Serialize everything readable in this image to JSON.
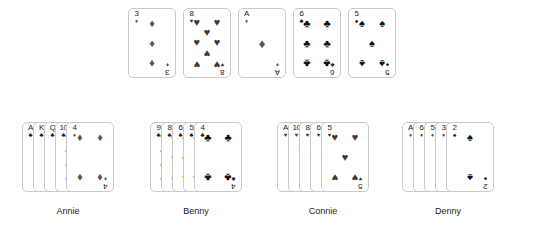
{
  "figure": {
    "background": "#ffffff",
    "suit_glyphs": {
      "spade": "♠",
      "heart": "♥",
      "diamond": "♦",
      "club": "♣"
    },
    "suit_colors": {
      "spade": "#111111",
      "heart": "#3a3a3a",
      "diamond": "#555555",
      "club": "#111111"
    }
  },
  "community_row": {
    "name": "community-cards",
    "cards": [
      {
        "rank": "3",
        "suit": "diamond",
        "pip_count": 3,
        "label": "3 of Diamonds"
      },
      {
        "rank": "8",
        "suit": "heart",
        "pip_count": 8,
        "label": "8 of Hearts"
      },
      {
        "rank": "A",
        "suit": "diamond",
        "pip_count": 1,
        "label": "Ace of Diamonds"
      },
      {
        "rank": "6",
        "suit": "club",
        "pip_count": 6,
        "label": "6 of Clubs"
      },
      {
        "rank": "5",
        "suit": "spade",
        "pip_count": 5,
        "label": "5 of Spades"
      }
    ]
  },
  "hands": [
    {
      "player": "Annie",
      "cards": [
        {
          "rank": "A",
          "suit": "club",
          "pip_count": 1,
          "label": "Ace of Clubs"
        },
        {
          "rank": "K",
          "suit": "club",
          "pip_count": 0,
          "label": "King of Clubs"
        },
        {
          "rank": "Q",
          "suit": "club",
          "pip_count": 0,
          "label": "Queen of Clubs"
        },
        {
          "rank": "10",
          "suit": "club",
          "pip_count": 10,
          "label": "10 of Clubs"
        },
        {
          "rank": "4",
          "suit": "diamond",
          "pip_count": 4,
          "label": "4 of Diamonds"
        }
      ]
    },
    {
      "player": "Benny",
      "cards": [
        {
          "rank": "9",
          "suit": "club",
          "pip_count": 9,
          "label": "9 of Clubs"
        },
        {
          "rank": "8",
          "suit": "club",
          "pip_count": 8,
          "label": "8 of Clubs"
        },
        {
          "rank": "6",
          "suit": "club",
          "pip_count": 6,
          "label": "6 of Clubs"
        },
        {
          "rank": "5",
          "suit": "club",
          "pip_count": 5,
          "label": "5 of Clubs"
        },
        {
          "rank": "4",
          "suit": "club",
          "pip_count": 4,
          "label": "4 of Clubs"
        }
      ]
    },
    {
      "player": "Connie",
      "cards": [
        {
          "rank": "A",
          "suit": "heart",
          "pip_count": 1,
          "label": "Ace of Hearts"
        },
        {
          "rank": "10",
          "suit": "heart",
          "pip_count": 10,
          "label": "10 of Hearts"
        },
        {
          "rank": "8",
          "suit": "heart",
          "pip_count": 8,
          "label": "8 of Hearts"
        },
        {
          "rank": "6",
          "suit": "heart",
          "pip_count": 6,
          "label": "6 of Hearts"
        },
        {
          "rank": "5",
          "suit": "heart",
          "pip_count": 5,
          "label": "5 of Hearts"
        }
      ]
    },
    {
      "player": "Denny",
      "cards": [
        {
          "rank": "A",
          "suit": "diamond",
          "pip_count": 1,
          "label": "Ace of Diamonds"
        },
        {
          "rank": "6",
          "suit": "diamond",
          "pip_count": 6,
          "label": "6 of Diamonds"
        },
        {
          "rank": "5",
          "suit": "diamond",
          "pip_count": 5,
          "label": "5 of Diamonds"
        },
        {
          "rank": "3",
          "suit": "diamond",
          "pip_count": 3,
          "label": "3 of Diamonds"
        },
        {
          "rank": "2",
          "suit": "spade",
          "pip_count": 2,
          "label": "2 of Spades"
        }
      ]
    }
  ],
  "layout": {
    "community_start_x": 128,
    "community_y": 8,
    "community_gap": 55,
    "hand_y": 122,
    "hand_overlap": 11,
    "label_y": 206,
    "hand_origins": [
      22,
      150,
      277,
      402
    ]
  }
}
